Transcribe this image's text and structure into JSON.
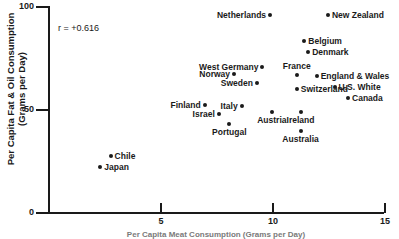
{
  "chart_data": {
    "type": "scatter",
    "title": "",
    "xlabel": "Per Capita Meat Consumption (Grams per Day)",
    "ylabel": "Per Capita Fat & Oil Consumption\n(Grams per Day)",
    "annotation": "r = +0.616",
    "xlim": [
      0,
      15
    ],
    "ylim": [
      0,
      100
    ],
    "xticks": [
      5,
      10,
      15
    ],
    "xtick_labels": [
      "5",
      "10",
      "15"
    ],
    "yticks": [
      0,
      50,
      100
    ],
    "ytick_labels": [
      "0",
      "50",
      "100"
    ],
    "grid": false,
    "legend": "none",
    "points": [
      {
        "label": "Netherlands",
        "x": 9.87,
        "y": 96.1,
        "pos": "left"
      },
      {
        "label": "New Zealand",
        "x": 12.45,
        "y": 96.1,
        "pos": "right"
      },
      {
        "label": "Belgium",
        "x": 11.4,
        "y": 83.6,
        "pos": "right"
      },
      {
        "label": "Denmark",
        "x": 11.57,
        "y": 78.3,
        "pos": "right"
      },
      {
        "label": "West Germany",
        "x": 9.53,
        "y": 71.0,
        "pos": "left"
      },
      {
        "label": "Norway",
        "x": 8.26,
        "y": 67.6,
        "pos": "left"
      },
      {
        "label": "France",
        "x": 11.06,
        "y": 67.1,
        "pos": "above"
      },
      {
        "label": "England & Wales",
        "x": 11.95,
        "y": 66.7,
        "pos": "right"
      },
      {
        "label": "Sweden",
        "x": 9.28,
        "y": 63.3,
        "pos": "left"
      },
      {
        "label": "Switzerland",
        "x": 11.06,
        "y": 60.4,
        "pos": "right"
      },
      {
        "label": "U.S. White",
        "x": 12.75,
        "y": 61.4,
        "pos": "right"
      },
      {
        "label": "Canada",
        "x": 13.35,
        "y": 55.6,
        "pos": "right"
      },
      {
        "label": "Finland",
        "x": 6.95,
        "y": 52.2,
        "pos": "left"
      },
      {
        "label": "Italy",
        "x": 8.6,
        "y": 51.7,
        "pos": "left"
      },
      {
        "label": "Israel",
        "x": 7.58,
        "y": 48.3,
        "pos": "left"
      },
      {
        "label": "Austria",
        "x": 9.95,
        "y": 48.8,
        "pos": "below"
      },
      {
        "label": "Ireland",
        "x": 11.23,
        "y": 48.8,
        "pos": "below"
      },
      {
        "label": "Portugal",
        "x": 8.05,
        "y": 43.0,
        "pos": "below"
      },
      {
        "label": "Australia",
        "x": 11.23,
        "y": 39.6,
        "pos": "below"
      },
      {
        "label": "Chile",
        "x": 2.75,
        "y": 27.5,
        "pos": "right"
      },
      {
        "label": "Japan",
        "x": 2.29,
        "y": 22.2,
        "pos": "right"
      }
    ]
  }
}
